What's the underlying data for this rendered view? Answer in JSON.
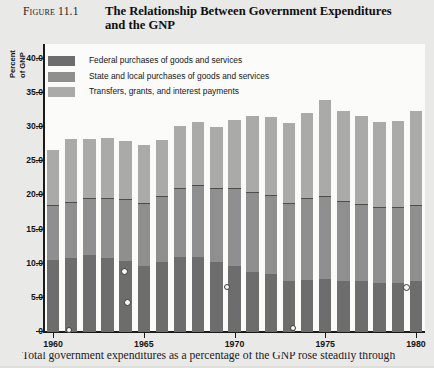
{
  "figure": {
    "label": "Figure 11.1",
    "title": "The Relationship Between Government Expenditures and the GNP"
  },
  "legend": {
    "position": "top-left-inside-plot",
    "items": [
      {
        "label": "Federal purchases of goods and services",
        "color": "#6d6d6d",
        "key": "federal"
      },
      {
        "label": "State and local purchases of goods and services",
        "color": "#8f8f8f",
        "key": "state_local"
      },
      {
        "label": "Transfers, grants, and interest payments",
        "color": "#aaaaa8",
        "key": "transfers"
      }
    ]
  },
  "y_axis": {
    "title_line1": "Percent",
    "title_line2": "of GNP",
    "ticks": [
      "40.0",
      "35.0",
      "30.0",
      "25.0",
      "20.0",
      "15.0",
      "10.0",
      "5.0",
      "0"
    ]
  },
  "x_axis": {
    "ticks": [
      "1960",
      "1965",
      "1970",
      "1975",
      "1980"
    ]
  },
  "caption": {
    "text": "Total government expenditures as a percentage of the GNP rose steadily through"
  },
  "chart_data": {
    "type": "bar",
    "title": "The Relationship Between Government Expenditures and the GNP",
    "subtitle": "Figure 11.1",
    "xlabel": "",
    "ylabel": "Percent of GNP",
    "ylim": [
      0,
      42
    ],
    "ytick_values": [
      0,
      5,
      10,
      15,
      20,
      25,
      30,
      35,
      40
    ],
    "grid": false,
    "stacked": true,
    "legend_position": "upper left",
    "categories": [
      "1960",
      "1961",
      "1962",
      "1963",
      "1964",
      "1965",
      "1966",
      "1967",
      "1968",
      "1969",
      "1970",
      "1971",
      "1972",
      "1973",
      "1974",
      "1975",
      "1976",
      "1977",
      "1978",
      "1979",
      "1980"
    ],
    "series": [
      {
        "name": "Federal purchases of goods and services",
        "color": "#6d6d6d",
        "values": [
          10.6,
          10.8,
          11.2,
          10.8,
          10.4,
          9.6,
          10.2,
          11.0,
          11.0,
          10.3,
          9.7,
          8.8,
          8.5,
          7.5,
          7.6,
          7.7,
          7.4,
          7.4,
          7.2,
          7.2,
          7.4
        ]
      },
      {
        "name": "State and local purchases of goods and services",
        "color": "#8f8f8f",
        "values": [
          7.9,
          8.1,
          8.2,
          8.6,
          8.9,
          9.1,
          9.6,
          10.0,
          10.3,
          10.6,
          11.2,
          11.6,
          11.4,
          11.3,
          11.8,
          12.0,
          11.6,
          11.2,
          11.0,
          10.9,
          11.1
        ]
      },
      {
        "name": "Transfers, grants, and interest payments",
        "color": "#aaaaa8",
        "values": [
          8.1,
          9.3,
          8.8,
          9.0,
          8.6,
          8.6,
          8.3,
          9.2,
          9.4,
          9.1,
          10.1,
          11.2,
          11.6,
          11.8,
          12.6,
          14.3,
          13.4,
          13.0,
          12.6,
          12.8,
          13.8
        ]
      }
    ],
    "totals": [
      26.6,
      28.2,
      28.2,
      28.4,
      27.9,
      27.3,
      28.1,
      30.2,
      30.7,
      30.0,
      31.0,
      31.6,
      31.5,
      30.6,
      32.0,
      34.0,
      32.4,
      31.6,
      30.8,
      30.9,
      32.3
    ]
  }
}
